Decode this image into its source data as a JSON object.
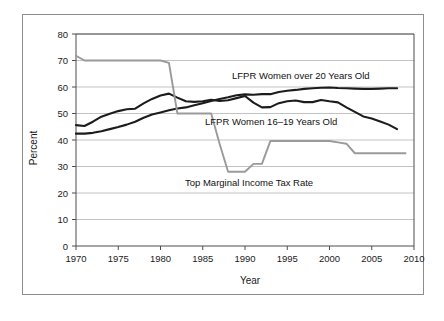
{
  "chart_data": {
    "type": "line",
    "title": "",
    "xlabel": "Year",
    "ylabel": "Percent",
    "xlim": [
      1970,
      2010
    ],
    "ylim": [
      0,
      80
    ],
    "grid": true,
    "legend_position": "inline-annotations",
    "xticks": [
      1970,
      1975,
      1980,
      1985,
      1990,
      1995,
      2000,
      2005,
      2010
    ],
    "yticks": [
      0,
      10,
      20,
      30,
      40,
      50,
      60,
      70,
      80
    ],
    "series": [
      {
        "name": "LFPR Women over 20 Years Old",
        "color": "#1c1c1c",
        "width": 2.1,
        "x": [
          1970,
          1971,
          1972,
          1973,
          1974,
          1975,
          1976,
          1977,
          1978,
          1979,
          1980,
          1981,
          1982,
          1983,
          1984,
          1985,
          1986,
          1987,
          1988,
          1989,
          1990,
          1991,
          1992,
          1993,
          1994,
          1995,
          1996,
          1997,
          1998,
          1999,
          2000,
          2001,
          2002,
          2003,
          2004,
          2005,
          2006,
          2007,
          2008
        ],
        "values": [
          42.4,
          42.4,
          42.7,
          43.3,
          44.1,
          44.9,
          45.8,
          46.9,
          48.4,
          49.6,
          50.4,
          51.2,
          51.9,
          52.3,
          53.1,
          53.9,
          54.7,
          55.5,
          56.1,
          56.9,
          57.2,
          57.1,
          57.3,
          57.3,
          58.1,
          58.6,
          58.9,
          59.3,
          59.5,
          59.7,
          59.8,
          59.6,
          59.5,
          59.4,
          59.3,
          59.3,
          59.4,
          59.5,
          59.5
        ]
      },
      {
        "name": "LFPR Women 16–19 Years Old",
        "color": "#1c1c1c",
        "width": 2.1,
        "x": [
          1970,
          1971,
          1972,
          1973,
          1974,
          1975,
          1976,
          1977,
          1978,
          1979,
          1980,
          1981,
          1982,
          1983,
          1984,
          1985,
          1986,
          1987,
          1988,
          1989,
          1990,
          1991,
          1992,
          1993,
          1994,
          1995,
          1996,
          1997,
          1998,
          1999,
          2000,
          2001,
          2002,
          2003,
          2004,
          2005,
          2006,
          2007,
          2008
        ],
        "values": [
          45.6,
          45.3,
          46.9,
          48.8,
          49.9,
          50.9,
          51.6,
          51.8,
          53.8,
          55.5,
          56.8,
          57.5,
          56.0,
          54.6,
          54.4,
          54.6,
          55.2,
          54.7,
          55.0,
          55.8,
          56.6,
          54.1,
          52.3,
          52.4,
          53.9,
          54.6,
          54.9,
          54.3,
          54.3,
          55.1,
          54.6,
          54.2,
          52.3,
          50.6,
          48.9,
          48.1,
          47.0,
          45.8,
          44.1
        ]
      },
      {
        "name": "Top Marginal Income Tax Rate",
        "color": "#9a9a9a",
        "width": 1.9,
        "x": [
          1970,
          1971,
          1972,
          1973,
          1974,
          1975,
          1976,
          1977,
          1978,
          1979,
          1980,
          1981,
          1982,
          1983,
          1984,
          1985,
          1986,
          1987,
          1988,
          1989,
          1990,
          1991,
          1992,
          1993,
          1994,
          1995,
          1996,
          1997,
          1998,
          1999,
          2000,
          2001,
          2002,
          2003,
          2004,
          2005,
          2006,
          2007,
          2008,
          2009
        ],
        "values": [
          71.8,
          70.0,
          70.0,
          70.0,
          70.0,
          70.0,
          70.0,
          70.0,
          70.0,
          70.0,
          70.0,
          69.1,
          50.0,
          50.0,
          50.0,
          50.0,
          50.0,
          38.5,
          28.0,
          28.0,
          28.0,
          31.0,
          31.0,
          39.6,
          39.6,
          39.6,
          39.6,
          39.6,
          39.6,
          39.6,
          39.6,
          39.1,
          38.6,
          35.0,
          35.0,
          35.0,
          35.0,
          35.0,
          35.0,
          35.0
        ]
      }
    ],
    "annotations": [
      {
        "text": "LFPR Women over 20 Years Old",
        "x_px": 232,
        "y_px": 79,
        "anchor": "start"
      },
      {
        "text": "LFPR Women 16–19 Years Old",
        "x_px": 205,
        "y_px": 125,
        "anchor": "start"
      },
      {
        "text": "Top Marginal Income Tax Rate",
        "x_px": 185,
        "y_px": 186,
        "anchor": "start"
      }
    ]
  }
}
